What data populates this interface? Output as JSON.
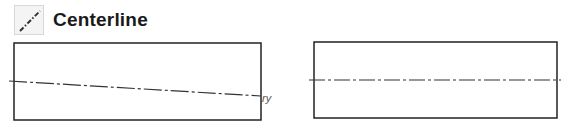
{
  "header": {
    "title": "Centerline",
    "icon": "centerline-icon"
  },
  "figures": [
    {
      "name": "incorrect-centerline",
      "description": "Sloped centerline misaligned with rectangle",
      "annotation": "ry"
    },
    {
      "name": "correct-centerline",
      "description": "Horizontal centerline through rectangle center"
    }
  ],
  "colors": {
    "line": "#222222",
    "icon_bg": "#f4f4f4"
  }
}
